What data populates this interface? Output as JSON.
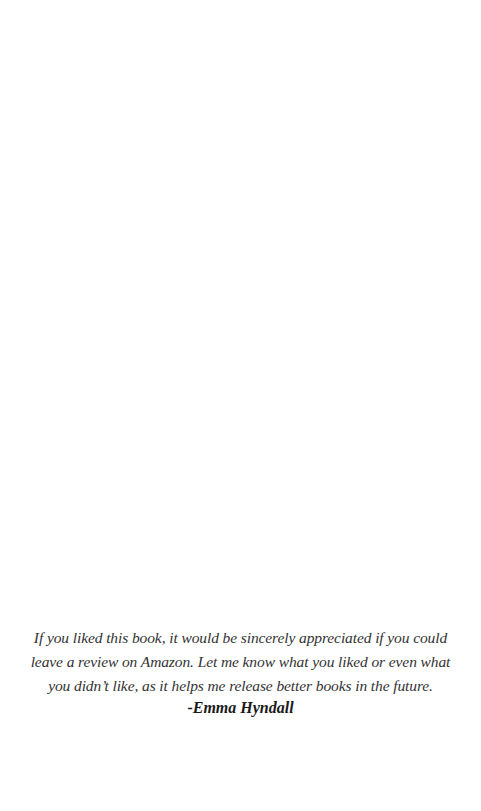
{
  "page": {
    "background": "#ffffff"
  },
  "note": {
    "lines": [
      "If you liked this book, it would be sincerely appreciated if you could",
      "leave a review on Amazon. Let me know what you liked or even what",
      "you didn’t like, as it helps me release better books in the future."
    ],
    "signature": "-Emma Hyndall",
    "text_color": "#333333"
  }
}
